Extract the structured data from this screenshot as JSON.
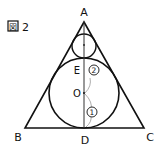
{
  "figure": {
    "caption_box": "図",
    "caption_num": "2"
  },
  "points": {
    "A": "A",
    "B": "B",
    "C": "C",
    "D": "D",
    "E": "E",
    "O": "O"
  },
  "segments": {
    "seg1": "①",
    "seg2": "②"
  }
}
